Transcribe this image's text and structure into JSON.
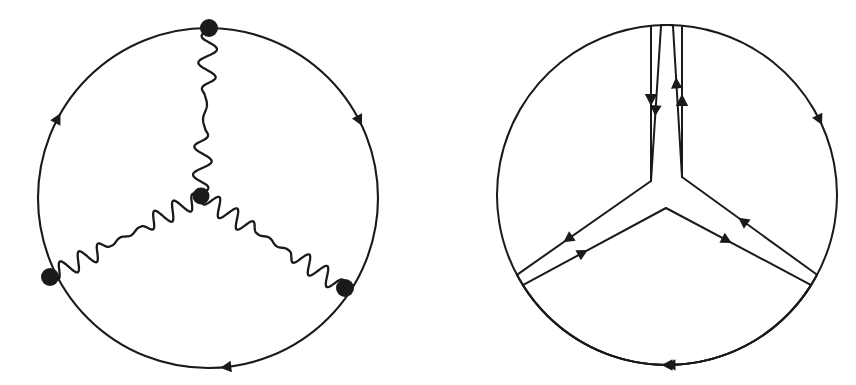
{
  "figure": {
    "kind": "feynman-diagram-pair",
    "background_color": "#ffffff",
    "ink_color": "#1a1a1a",
    "width": 856,
    "height": 385,
    "caption": "",
    "panels": [
      {
        "id": "left",
        "name": "three-photon-vertex-correction",
        "description": "Closed fermion loop with three internal photon lines meeting at a central three-gluon-like vertex",
        "circle": {
          "cx": 208,
          "cy": 198,
          "r": 170,
          "stroke_width": 2.1
        },
        "center_vertex": {
          "x": 201,
          "y": 196,
          "r": 8.5
        },
        "boundary_vertices": [
          {
            "name": "vertex-top",
            "x": 209,
            "y": 28,
            "r": 9.0,
            "angle_deg": -90
          },
          {
            "name": "vertex-lower-left",
            "x": 50,
            "y": 277,
            "r": 9.0,
            "angle_deg": 150
          },
          {
            "name": "vertex-lower-right",
            "x": 345,
            "y": 288,
            "r": 9.0,
            "angle_deg": 30
          }
        ],
        "photon_lines": [
          {
            "name": "photon-top",
            "from": "vertex-top",
            "to": "center-vertex",
            "wave_cycles": 6,
            "amplitude": 9,
            "stroke_width": 2.3
          },
          {
            "name": "photon-lower-left",
            "from": "vertex-lower-left",
            "to": "center-vertex",
            "wave_cycles": 8,
            "amplitude": 9,
            "stroke_width": 2.3
          },
          {
            "name": "photon-lower-right",
            "from": "center-vertex",
            "to": "vertex-lower-right",
            "wave_cycles": 8,
            "amplitude": 9,
            "stroke_width": 2.3
          }
        ],
        "loop_arrows": [
          {
            "name": "arrow-upper-left",
            "angle_deg": 208,
            "direction": "counterclockwise-flow",
            "size": 11
          },
          {
            "name": "arrow-upper-right",
            "angle_deg": -27,
            "direction": "counterclockwise-flow",
            "size": 11
          },
          {
            "name": "arrow-bottom",
            "angle_deg": 84,
            "direction": "counterclockwise-flow",
            "size": 11
          }
        ]
      },
      {
        "id": "right",
        "name": "three-sector-fermion-flow",
        "description": "Circle cut into three pie sectors separated by gaps, each sector outlined with directed fermion lines",
        "circle": {
          "cx": 239,
          "cy": 195,
          "r": 170,
          "stroke_width": 2.0
        },
        "hub": {
          "x": 238,
          "y": 204
        },
        "gap_half_width_deg": 5,
        "sectors": [
          {
            "name": "sector-upper-left",
            "arc_start_deg": 268,
            "arc_end_deg": 152,
            "apex": {
              "x": 223,
              "y": 181
            },
            "arrows": [
              {
                "name": "arrow-upper-left-arc",
                "t": 0.27,
                "along": "forward",
                "size": 11
              },
              {
                "name": "arrow-upper-left-spoke-in",
                "t": 0.55,
                "along": "forward",
                "size": 11
              }
            ]
          },
          {
            "name": "sector-upper-right",
            "arc_start_deg": 28,
            "arc_end_deg": 272,
            "apex": {
              "x": 254,
              "y": 177
            },
            "arrows": [
              {
                "name": "arrow-upper-right-arc",
                "t": 0.25,
                "along": "forward",
                "size": 11
              },
              {
                "name": "arrow-upper-right-spoke-in",
                "t": 0.55,
                "along": "forward",
                "size": 11
              }
            ]
          },
          {
            "name": "sector-bottom",
            "arc_start_deg": 32,
            "arc_end_deg": 148,
            "apex": {
              "x": 238,
              "y": 208
            },
            "arrows": [
              {
                "name": "arrow-bottom-arc",
                "t": 0.5,
                "along": "forward",
                "size": 11
              },
              {
                "name": "arrow-bottom-left-spoke",
                "t": 0.42,
                "along": "forward",
                "size": 11
              },
              {
                "name": "arrow-bottom-right-spoke",
                "t": 0.42,
                "along": "forward",
                "size": 11
              }
            ]
          }
        ]
      }
    ]
  }
}
